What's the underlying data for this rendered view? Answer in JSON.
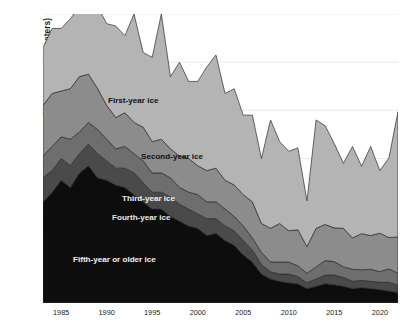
{
  "chart_data": {
    "type": "area",
    "title": "",
    "xlabel": "",
    "ylabel": "Ice Extent at Minimum September Week (million square kilometers)",
    "xlim": [
      1983,
      2022
    ],
    "ylim": [
      0,
      6
    ],
    "yticks": [
      0,
      1,
      2,
      3,
      4,
      5,
      6
    ],
    "xticks": [
      1985,
      1990,
      1995,
      2000,
      2005,
      2010,
      2015,
      2020
    ],
    "grid": "horizontal",
    "legend_position": "in-chart-annotations",
    "stacked": true,
    "stack_order_bottom_to_top": [
      "Fifth-year or older ice",
      "Fourth-year ice",
      "Third-year ice",
      "Second-year ice",
      "First-year ice"
    ],
    "x": [
      1983,
      1984,
      1985,
      1986,
      1987,
      1988,
      1989,
      1990,
      1991,
      1992,
      1993,
      1994,
      1995,
      1996,
      1997,
      1998,
      1999,
      2000,
      2001,
      2002,
      2003,
      2004,
      2005,
      2006,
      2007,
      2008,
      2009,
      2010,
      2011,
      2012,
      2013,
      2014,
      2015,
      2016,
      2017,
      2018,
      2019,
      2020,
      2021,
      2022
    ],
    "series": [
      {
        "name": "Fifth-year or older ice",
        "color": "#0d0d0d",
        "values": [
          2.1,
          2.3,
          2.55,
          2.4,
          2.7,
          2.85,
          2.6,
          2.55,
          2.45,
          2.4,
          2.25,
          2.1,
          1.95,
          1.95,
          1.8,
          1.7,
          1.6,
          1.55,
          1.4,
          1.45,
          1.3,
          1.2,
          1.0,
          0.85,
          0.6,
          0.5,
          0.45,
          0.42,
          0.4,
          0.3,
          0.35,
          0.4,
          0.38,
          0.35,
          0.3,
          0.32,
          0.3,
          0.28,
          0.25,
          0.22
        ]
      },
      {
        "name": "Fourth-year ice",
        "color": "#4a4a4a",
        "values": [
          0.5,
          0.45,
          0.45,
          0.45,
          0.4,
          0.45,
          0.5,
          0.4,
          0.35,
          0.4,
          0.45,
          0.4,
          0.35,
          0.35,
          0.4,
          0.35,
          0.35,
          0.3,
          0.35,
          0.3,
          0.3,
          0.3,
          0.3,
          0.25,
          0.2,
          0.15,
          0.15,
          0.18,
          0.15,
          0.12,
          0.15,
          0.18,
          0.2,
          0.18,
          0.15,
          0.15,
          0.15,
          0.15,
          0.18,
          0.15
        ]
      },
      {
        "name": "Third-year ice",
        "color": "#6e6e6e",
        "values": [
          0.45,
          0.5,
          0.45,
          0.55,
          0.45,
          0.45,
          0.5,
          0.45,
          0.4,
          0.45,
          0.4,
          0.45,
          0.4,
          0.4,
          0.4,
          0.35,
          0.35,
          0.4,
          0.35,
          0.35,
          0.35,
          0.3,
          0.3,
          0.25,
          0.25,
          0.2,
          0.25,
          0.25,
          0.22,
          0.2,
          0.25,
          0.3,
          0.28,
          0.22,
          0.25,
          0.22,
          0.25,
          0.22,
          0.28,
          0.25
        ]
      },
      {
        "name": "Second-year ice",
        "color": "#8c8c8c",
        "values": [
          1.05,
          1.1,
          0.95,
          1.05,
          1.15,
          1.0,
          0.85,
          0.7,
          0.65,
          0.7,
          0.65,
          0.7,
          0.65,
          0.7,
          0.6,
          0.65,
          0.7,
          0.6,
          0.65,
          0.7,
          0.6,
          0.65,
          0.65,
          0.75,
          0.6,
          0.7,
          0.8,
          0.65,
          0.75,
          0.55,
          0.8,
          0.75,
          0.7,
          0.8,
          0.65,
          0.75,
          0.7,
          0.8,
          0.65,
          0.75
        ]
      },
      {
        "name": "First-year ice",
        "color": "#b4b4b4",
        "values": [
          1.2,
          1.35,
          1.3,
          1.45,
          1.45,
          2.25,
          1.7,
          1.7,
          1.9,
          1.6,
          2.25,
          1.55,
          1.75,
          2.6,
          1.5,
          1.95,
          1.6,
          1.75,
          2.15,
          2.35,
          1.8,
          2.0,
          1.65,
          1.8,
          1.35,
          2.25,
          1.7,
          1.65,
          1.7,
          0.95,
          2.25,
          2.05,
          1.75,
          1.35,
          1.9,
          1.4,
          1.85,
          1.3,
          1.65,
          2.6
        ]
      }
    ],
    "annotations": [
      {
        "label": "First-year ice",
        "series": "First-year ice"
      },
      {
        "label": "Second-year ice",
        "series": "Second-year ice"
      },
      {
        "label": "Third-year ice",
        "series": "Third-year ice"
      },
      {
        "label": "Fourth-year ice",
        "series": "Fourth-year ice"
      },
      {
        "label": "Fifth-year or older ice",
        "series": "Fifth-year or older ice"
      }
    ]
  },
  "axis": {
    "y_title": "Ice Extent at Minimum September Week (million square kilometers)",
    "y_ticks": [
      "6",
      "5",
      "4",
      "3",
      "2",
      "1",
      "0"
    ],
    "x_ticks": [
      "1985",
      "1990",
      "1995",
      "2000",
      "2005",
      "2010",
      "2015",
      "2020"
    ]
  },
  "labels": {
    "first_year": "First-year ice",
    "second_year": "Second-year ice",
    "third_year": "Third-year ice",
    "fourth_year": "Fourth-year ice",
    "fifth_year": "Fifth-year or older ice"
  },
  "colors": {
    "first_year": "#b4b4b4",
    "second_year": "#8c8c8c",
    "third_year": "#6e6e6e",
    "fourth_year": "#4a4a4a",
    "fifth_year": "#0d0d0d",
    "grid": "#e8e8e8",
    "outline": "#2b2b2b"
  }
}
